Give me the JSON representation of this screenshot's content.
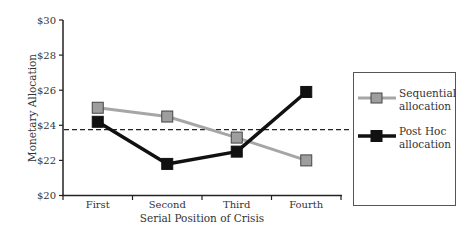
{
  "chart_data": {
    "type": "line",
    "title": "",
    "xlabel": "Serial Position of Crisis",
    "ylabel": "Monetary Allocation",
    "categories": [
      "First",
      "Second",
      "Third",
      "Fourth"
    ],
    "y_ticks": [
      "$20",
      "$22",
      "$24",
      "$26",
      "$28",
      "$30"
    ],
    "ylim": [
      20,
      30
    ],
    "grid": false,
    "legend_position": "right",
    "series": [
      {
        "name": "Sequential allocation",
        "color": "#a6a6a6",
        "marker_fill": "#9e9e9e",
        "values": [
          25.0,
          24.5,
          23.3,
          22.0
        ]
      },
      {
        "name": "Post Hoc allocation",
        "color": "#111111",
        "marker_fill": "#111111",
        "values": [
          24.2,
          21.8,
          22.5,
          25.9
        ]
      }
    ],
    "reference_line": {
      "style": "dashed",
      "value": 23.75
    }
  },
  "legend": {
    "items": [
      {
        "line1": "Sequential",
        "line2": "allocation"
      },
      {
        "line1": "Post Hoc",
        "line2": "allocation"
      }
    ]
  }
}
